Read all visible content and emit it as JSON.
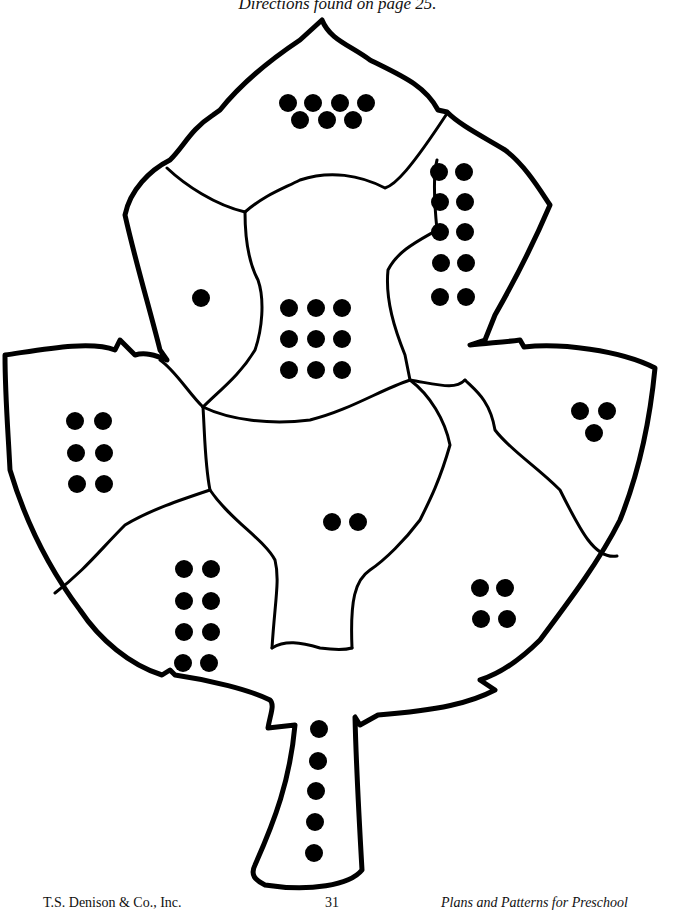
{
  "header": {
    "directions": "Directions found on page 25."
  },
  "worksheet": {
    "title": "Leaf dot-counting pattern",
    "outline_color": "#000000",
    "dot_color": "#000000",
    "segments": [
      {
        "name": "top-peak",
        "count": 7,
        "dots": [
          [
            288,
            103
          ],
          [
            313,
            103
          ],
          [
            340,
            103
          ],
          [
            366,
            103
          ],
          [
            300,
            120
          ],
          [
            327,
            120
          ],
          [
            353,
            120
          ]
        ]
      },
      {
        "name": "upper-right",
        "count": 10,
        "dots": [
          [
            439,
            172
          ],
          [
            464,
            172
          ],
          [
            440,
            202
          ],
          [
            465,
            202
          ],
          [
            440,
            232
          ],
          [
            465,
            232
          ],
          [
            441,
            263
          ],
          [
            466,
            263
          ],
          [
            440,
            297
          ],
          [
            466,
            297
          ]
        ]
      },
      {
        "name": "upper-left",
        "count": 1,
        "dots": [
          [
            201,
            298
          ]
        ]
      },
      {
        "name": "upper-center",
        "count": 9,
        "dots": [
          [
            289,
            308
          ],
          [
            316,
            308
          ],
          [
            342,
            308
          ],
          [
            289,
            339
          ],
          [
            316,
            339
          ],
          [
            342,
            339
          ],
          [
            289,
            370
          ],
          [
            316,
            370
          ],
          [
            342,
            370
          ]
        ]
      },
      {
        "name": "left-lobe",
        "count": 6,
        "dots": [
          [
            75,
            421
          ],
          [
            103,
            421
          ],
          [
            76,
            453
          ],
          [
            104,
            453
          ],
          [
            77,
            484
          ],
          [
            104,
            484
          ]
        ]
      },
      {
        "name": "right-lobe",
        "count": 3,
        "dots": [
          [
            580,
            411
          ],
          [
            607,
            411
          ],
          [
            594,
            433
          ]
        ]
      },
      {
        "name": "center",
        "count": 2,
        "dots": [
          [
            332,
            522
          ],
          [
            358,
            522
          ]
        ]
      },
      {
        "name": "lower-left",
        "count": 8,
        "dots": [
          [
            184,
            569
          ],
          [
            211,
            569
          ],
          [
            184,
            601
          ],
          [
            211,
            601
          ],
          [
            184,
            632
          ],
          [
            211,
            632
          ],
          [
            183,
            663
          ],
          [
            209,
            663
          ]
        ]
      },
      {
        "name": "lower-right",
        "count": 4,
        "dots": [
          [
            480,
            588
          ],
          [
            505,
            588
          ],
          [
            481,
            619
          ],
          [
            507,
            619
          ]
        ]
      },
      {
        "name": "stem",
        "count": 5,
        "dots": [
          [
            319,
            729
          ],
          [
            318,
            761
          ],
          [
            316,
            791
          ],
          [
            315,
            822
          ],
          [
            314,
            853
          ]
        ]
      }
    ]
  },
  "footer": {
    "publisher": "T.S. Denison & Co., Inc.",
    "page_number": "31",
    "book_title": "Plans and Patterns for Preschool"
  }
}
